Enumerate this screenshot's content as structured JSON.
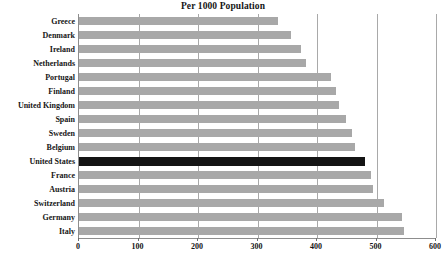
{
  "chart_data": {
    "type": "bar",
    "orientation": "horizontal",
    "title": "Per 1000 Population",
    "xlabel": "",
    "ylabel": "",
    "xlim": [
      0,
      600
    ],
    "xticks": [
      0,
      100,
      200,
      300,
      400,
      500,
      600
    ],
    "xtick_labels": [
      "0",
      "100",
      "200",
      "300",
      "400",
      "500",
      "600"
    ],
    "grid": true,
    "grid_axis": "x",
    "legend": false,
    "bar_color": "#a8a8a8",
    "highlight_color": "#141414",
    "highlight_category": "United States",
    "categories": [
      "Greece",
      "Denmark",
      "Ireland",
      "Netherlands",
      "Portugal",
      "Finland",
      "United Kingdom",
      "Spain",
      "Sweden",
      "Belgium",
      "United States",
      "France",
      "Austria",
      "Switzerland",
      "Germany",
      "Italy"
    ],
    "values": [
      334,
      356,
      373,
      381,
      423,
      432,
      437,
      448,
      458,
      464,
      481,
      490,
      494,
      512,
      543,
      546
    ]
  }
}
